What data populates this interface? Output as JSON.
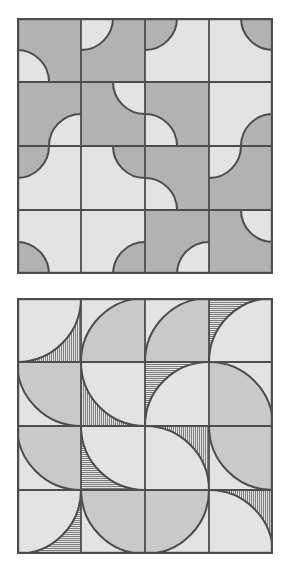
{
  "figure": {
    "panel_count": 2,
    "canvas": {
      "width": 291,
      "height": 581,
      "background": "#ffffff"
    }
  },
  "colors": {
    "dark_gray": "#b2b2b2",
    "light_gray": "#e3e3e3",
    "medium_gray": "#c9c9c9",
    "stroke": "#4d4d4d",
    "hatch_line": "#7d7d7d",
    "background": "#ffffff"
  },
  "geometry": {
    "origin_x": 17,
    "panel_top_y": 18,
    "panel_bottom_y": 298,
    "panel_size": 256,
    "grid_cols": 4,
    "grid_rows": 4,
    "tile_size": 64,
    "border_width": 2.2,
    "grid_line_width": 1.8,
    "arc_line_width": 2.0,
    "hatch_spacing": 2,
    "hatch_width": 1
  },
  "panels": [
    {
      "id": "panel-top",
      "name": "small-arc-panel",
      "label": "Panel A",
      "arc_radius_ratio": 0.5,
      "tiles": [
        {
          "r": 0,
          "c": 0,
          "corner": "bl",
          "arc_fill": "light_gray",
          "bg_fill": "dark_gray"
        },
        {
          "r": 0,
          "c": 1,
          "corner": "tl",
          "arc_fill": "light_gray",
          "bg_fill": "dark_gray"
        },
        {
          "r": 0,
          "c": 2,
          "corner": "tl",
          "arc_fill": "dark_gray",
          "bg_fill": "light_gray"
        },
        {
          "r": 0,
          "c": 3,
          "corner": "tr",
          "arc_fill": "dark_gray",
          "bg_fill": "light_gray"
        },
        {
          "r": 1,
          "c": 0,
          "corner": "br",
          "arc_fill": "light_gray",
          "bg_fill": "dark_gray"
        },
        {
          "r": 1,
          "c": 1,
          "corner": "tr",
          "arc_fill": "light_gray",
          "bg_fill": "dark_gray"
        },
        {
          "r": 1,
          "c": 2,
          "corner": "bl",
          "arc_fill": "light_gray",
          "bg_fill": "dark_gray"
        },
        {
          "r": 1,
          "c": 3,
          "corner": "br",
          "arc_fill": "dark_gray",
          "bg_fill": "light_gray"
        },
        {
          "r": 2,
          "c": 0,
          "corner": "tl",
          "arc_fill": "dark_gray",
          "bg_fill": "light_gray"
        },
        {
          "r": 2,
          "c": 1,
          "corner": "tr",
          "arc_fill": "dark_gray",
          "bg_fill": "light_gray"
        },
        {
          "r": 2,
          "c": 2,
          "corner": "bl",
          "arc_fill": "light_gray",
          "bg_fill": "dark_gray"
        },
        {
          "r": 2,
          "c": 3,
          "corner": "tl",
          "arc_fill": "light_gray",
          "bg_fill": "dark_gray"
        },
        {
          "r": 3,
          "c": 0,
          "corner": "bl",
          "arc_fill": "dark_gray",
          "bg_fill": "light_gray"
        },
        {
          "r": 3,
          "c": 1,
          "corner": "br",
          "arc_fill": "dark_gray",
          "bg_fill": "light_gray"
        },
        {
          "r": 3,
          "c": 2,
          "corner": "br",
          "arc_fill": "light_gray",
          "bg_fill": "dark_gray"
        },
        {
          "r": 3,
          "c": 3,
          "corner": "tr",
          "arc_fill": "light_gray",
          "bg_fill": "dark_gray"
        }
      ]
    },
    {
      "id": "panel-bottom",
      "name": "large-arc-hatched-panel",
      "label": "Panel B",
      "arc_radius_ratio": 1.0,
      "tiles": [
        {
          "r": 0,
          "c": 0,
          "corner": "tl",
          "arc_fill": "light_gray",
          "bg_fill": "hatch_vertical"
        },
        {
          "r": 0,
          "c": 1,
          "corner": "br",
          "arc_fill": "medium_gray",
          "bg_fill": "light_gray"
        },
        {
          "r": 0,
          "c": 2,
          "corner": "br",
          "arc_fill": "medium_gray",
          "bg_fill": "light_gray"
        },
        {
          "r": 0,
          "c": 3,
          "corner": "br",
          "arc_fill": "light_gray",
          "bg_fill": "hatch_horizontal"
        },
        {
          "r": 1,
          "c": 0,
          "corner": "tr",
          "arc_fill": "medium_gray",
          "bg_fill": "light_gray"
        },
        {
          "r": 1,
          "c": 1,
          "corner": "tr",
          "arc_fill": "light_gray",
          "bg_fill": "hatch_vertical"
        },
        {
          "r": 1,
          "c": 2,
          "corner": "br",
          "arc_fill": "light_gray",
          "bg_fill": "hatch_horizontal"
        },
        {
          "r": 1,
          "c": 3,
          "corner": "bl",
          "arc_fill": "medium_gray",
          "bg_fill": "light_gray"
        },
        {
          "r": 2,
          "c": 0,
          "corner": "tr",
          "arc_fill": "medium_gray",
          "bg_fill": "light_gray"
        },
        {
          "r": 2,
          "c": 1,
          "corner": "tr",
          "arc_fill": "light_gray",
          "bg_fill": "hatch_horizontal"
        },
        {
          "r": 2,
          "c": 2,
          "corner": "bl",
          "arc_fill": "light_gray",
          "bg_fill": "hatch_vertical"
        },
        {
          "r": 2,
          "c": 3,
          "corner": "tr",
          "arc_fill": "medium_gray",
          "bg_fill": "light_gray"
        },
        {
          "r": 3,
          "c": 0,
          "corner": "tl",
          "arc_fill": "light_gray",
          "bg_fill": "hatch_horizontal"
        },
        {
          "r": 3,
          "c": 1,
          "corner": "tr",
          "arc_fill": "medium_gray",
          "bg_fill": "light_gray"
        },
        {
          "r": 3,
          "c": 2,
          "corner": "tl",
          "arc_fill": "medium_gray",
          "bg_fill": "light_gray"
        },
        {
          "r": 3,
          "c": 3,
          "corner": "bl",
          "arc_fill": "light_gray",
          "bg_fill": "hatch_vertical"
        }
      ]
    }
  ]
}
